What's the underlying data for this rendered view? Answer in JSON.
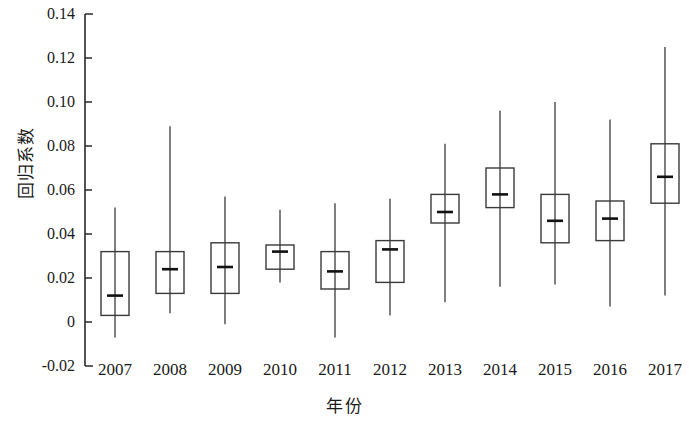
{
  "chart_data": {
    "type": "box",
    "title": "",
    "xlabel": "年份",
    "ylabel": "回归系数",
    "categories": [
      "2007",
      "2008",
      "2009",
      "2010",
      "2011",
      "2012",
      "2013",
      "2014",
      "2015",
      "2016",
      "2017"
    ],
    "ylim": [
      -0.02,
      0.14
    ],
    "ytick_labels": [
      "0.14",
      "0.12",
      "0.10",
      "0.08",
      "0.06",
      "0.04",
      "0.02",
      "0",
      "-0.02"
    ],
    "ytick_values": [
      0.14,
      0.12,
      0.1,
      0.08,
      0.06,
      0.04,
      0.02,
      0,
      -0.02
    ],
    "grid": false,
    "legend": "none",
    "boxes": [
      {
        "category": "2007",
        "whisker_low": -0.007,
        "q1": 0.003,
        "median": 0.012,
        "q3": 0.032,
        "whisker_high": 0.052
      },
      {
        "category": "2008",
        "whisker_low": 0.004,
        "q1": 0.013,
        "median": 0.024,
        "q3": 0.032,
        "whisker_high": 0.089
      },
      {
        "category": "2009",
        "whisker_low": -0.001,
        "q1": 0.013,
        "median": 0.025,
        "q3": 0.036,
        "whisker_high": 0.057
      },
      {
        "category": "2010",
        "whisker_low": 0.018,
        "q1": 0.024,
        "median": 0.032,
        "q3": 0.035,
        "whisker_high": 0.051
      },
      {
        "category": "2011",
        "whisker_low": -0.007,
        "q1": 0.015,
        "median": 0.023,
        "q3": 0.032,
        "whisker_high": 0.054
      },
      {
        "category": "2012",
        "whisker_low": 0.003,
        "q1": 0.018,
        "median": 0.033,
        "q3": 0.037,
        "whisker_high": 0.056
      },
      {
        "category": "2013",
        "whisker_low": 0.009,
        "q1": 0.045,
        "median": 0.05,
        "q3": 0.058,
        "whisker_high": 0.081
      },
      {
        "category": "2014",
        "whisker_low": 0.016,
        "q1": 0.052,
        "median": 0.058,
        "q3": 0.07,
        "whisker_high": 0.096
      },
      {
        "category": "2015",
        "whisker_low": 0.017,
        "q1": 0.036,
        "median": 0.046,
        "q3": 0.058,
        "whisker_high": 0.1
      },
      {
        "category": "2016",
        "whisker_low": 0.007,
        "q1": 0.037,
        "median": 0.047,
        "q3": 0.055,
        "whisker_high": 0.092
      },
      {
        "category": "2017",
        "whisker_low": 0.012,
        "q1": 0.054,
        "median": 0.066,
        "q3": 0.081,
        "whisker_high": 0.125
      }
    ],
    "colors": {
      "axis": "#2b2b2b",
      "box_stroke": "#3a3a3a",
      "whisker": "#3a3a3a",
      "median": "#111111",
      "background": "#ffffff"
    }
  },
  "layout": {
    "plot_left": 85,
    "plot_top": 14,
    "plot_bottom": 366,
    "plot_right": 689,
    "box_width": 28,
    "first_center": 115,
    "center_step": 55
  }
}
